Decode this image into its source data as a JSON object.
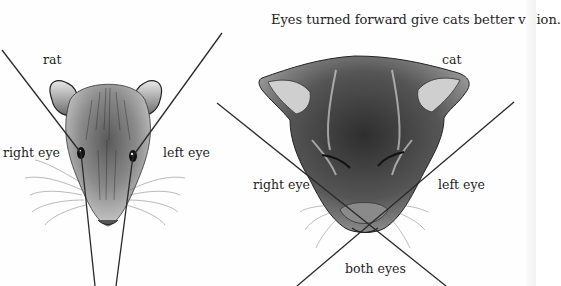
{
  "title": "Eyes turned forward give cats better vision.",
  "rat": {
    "label": "rat",
    "right_eye_label": "right eye",
    "left_eye_label": "left eye"
  },
  "cat": {
    "label": "cat",
    "right_eye_label": "right eye",
    "left_eye_label": "left eye",
    "overlap_label": "both eyes"
  },
  "colors": {
    "background": "#fefefe",
    "ink": "#1e1e1e",
    "sight_line": "#2a2a2a"
  }
}
